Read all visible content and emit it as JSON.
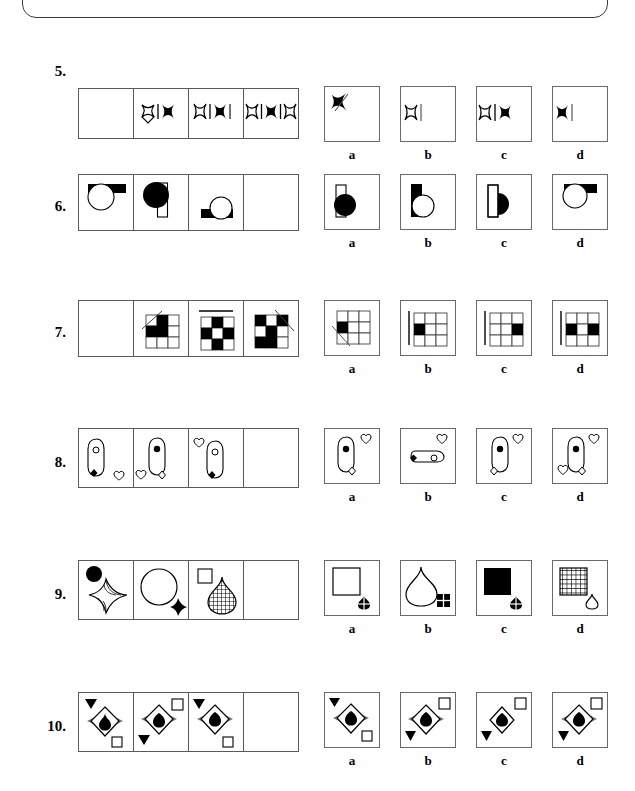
{
  "page": {
    "top_panel": "rounded-panel-cutoff",
    "ink_color": "#000000",
    "box_border_color": "#5a5a5a",
    "background": "#ffffff"
  },
  "option_labels": [
    "a",
    "b",
    "c",
    "d"
  ],
  "puzzles": [
    {
      "number": "5.",
      "sequence": [
        {
          "cell": 1,
          "content": "empty"
        },
        {
          "cell": 2,
          "content": "outline-4point-star, vertical-bar, solid-4point-star"
        },
        {
          "cell": 3,
          "content": "outline-4point-star, vertical-bar, solid-4point-star, vertical-bar"
        },
        {
          "cell": 4,
          "content": "outline-4point-star, vertical-bar, solid-4point-star, vertical-bar, outline-4point-star"
        }
      ],
      "options": [
        {
          "label": "a",
          "content": "solid-4point-star with diagonal line, top-left"
        },
        {
          "label": "b",
          "content": "outline-4point-star, vertical-bar"
        },
        {
          "label": "c",
          "content": "outline-4point-star, vertical-bar, solid-4point-star"
        },
        {
          "label": "d",
          "content": "solid-4point-star, vertical-bar"
        }
      ]
    },
    {
      "number": "6.",
      "sequence": [
        {
          "cell": 1,
          "content": "outline-circle with solid horizontal bar behind top"
        },
        {
          "cell": 2,
          "content": "solid-circle over tall outline-rectangle"
        },
        {
          "cell": 3,
          "content": "outline-circle on solid horizontal bar, lower right"
        },
        {
          "cell": 4,
          "content": "empty"
        }
      ],
      "options": [
        {
          "label": "a",
          "content": "tall outline-rectangle with solid-circle overlapping"
        },
        {
          "label": "b",
          "content": "tall solid-rectangle with outline-circle overlapping"
        },
        {
          "label": "c",
          "content": "tall outline-rectangle with solid half-circle"
        },
        {
          "label": "d",
          "content": "outline-circle with solid horizontal bar behind top"
        }
      ]
    },
    {
      "number": "7.",
      "sequence": [
        {
          "cell": 1,
          "content": "empty"
        },
        {
          "cell": 2,
          "content": "3x3 grid, 3 black cells, diagonal line top-left"
        },
        {
          "cell": 3,
          "content": "3x3 grid, 5 black cells, horizontal line above"
        },
        {
          "cell": 4,
          "content": "3x3 grid, checkered black cells, diagonal line top-right"
        }
      ],
      "options": [
        {
          "label": "a",
          "content": "3x3 grid, 1 black cell left-middle, diagonal line bottom-left"
        },
        {
          "label": "b",
          "content": "3x3 grid, 1 black cell left-middle, vertical line at left"
        },
        {
          "label": "c",
          "content": "3x3 grid, 1 black cell right-middle, vertical line at left"
        },
        {
          "label": "d",
          "content": "3x3 grid, 2 black cells left-middle and right-middle, vertical line at left"
        }
      ]
    },
    {
      "number": "8.",
      "sequence": [
        {
          "cell": 1,
          "content": "safety-pin outline with small open circle, solid diamond lower-left, outline heart lower-right"
        },
        {
          "cell": 2,
          "content": "safety-pin outline with solid dot, outline diamond lower-right, outline heart lower-left"
        },
        {
          "cell": 3,
          "content": "safety-pin outline with open circle, solid diamond lower-left, outline heart upper-left"
        },
        {
          "cell": 4,
          "content": "empty"
        }
      ],
      "options": [
        {
          "label": "a",
          "content": "safety-pin with solid dot, outline heart top-right, outline diamond bottom"
        },
        {
          "label": "b",
          "content": "horizontal safety-pin with solid diamond left, outline heart top-right"
        },
        {
          "label": "c",
          "content": "safety-pin with solid dot, outline heart top-right, outline diamond bottom-left"
        },
        {
          "label": "d",
          "content": "safety-pin with solid dot, outline heart top-right, outline diamond bottom-right, outline heart bottom-left"
        }
      ]
    },
    {
      "number": "9.",
      "sequence": [
        {
          "cell": 1,
          "content": "solid-circle top-left, outline 4-point-star with stripes"
        },
        {
          "cell": 2,
          "content": "large outline-circle, small solid 4-point-star lower-right"
        },
        {
          "cell": 3,
          "content": "small outline-square top-left, cross-hatched teardrop"
        },
        {
          "cell": 4,
          "content": "empty"
        }
      ],
      "options": [
        {
          "label": "a",
          "content": "large outline-square, small hatched teardrop lower-right"
        },
        {
          "label": "b",
          "content": "large outline-teardrop, small hatched square lower-right"
        },
        {
          "label": "c",
          "content": "large solid-square, small hatched teardrop lower-right"
        },
        {
          "label": "d",
          "content": "large cross-hatched square, small outline-teardrop lower-right"
        }
      ]
    },
    {
      "number": "10.",
      "sequence": [
        {
          "cell": 1,
          "content": "solid down-triangle top-left, star-burst diamond with solid teardrop, outline square bottom-right"
        },
        {
          "cell": 2,
          "content": "outline square top-right, star-burst diamond with solid heart, solid down-triangle bottom-left"
        },
        {
          "cell": 3,
          "content": "solid down-triangle top-left, star-burst diamond with solid heart, outline square bottom-right"
        },
        {
          "cell": 4,
          "content": "empty"
        }
      ],
      "options": [
        {
          "label": "a",
          "content": "solid down-triangle top-left, star-burst diamond with solid heart, outline square bottom-right"
        },
        {
          "label": "b",
          "content": "outline square top-right, star-burst diamond with solid heart, solid down-triangle bottom-left"
        },
        {
          "label": "c",
          "content": "outline square top-right, plain diamond with solid heart, solid down-triangle bottom-left"
        },
        {
          "label": "d",
          "content": "outline square top-right, star-burst diamond with solid heart, solid down-triangle bottom-left"
        }
      ]
    }
  ]
}
